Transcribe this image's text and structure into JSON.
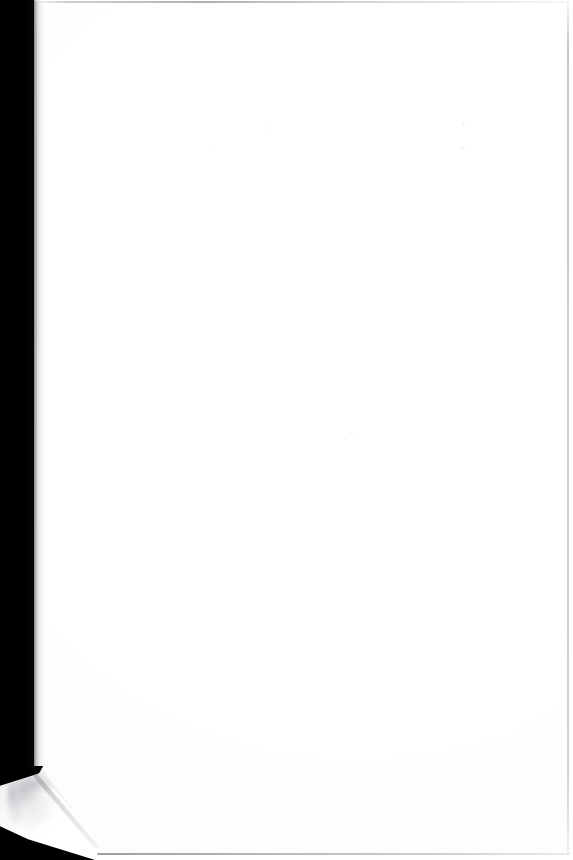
{
  "document": {
    "kind": "scanned-page",
    "description": "Scanned blank page from a bound volume",
    "page_text": "",
    "has_text": "false",
    "has_figures": "false",
    "has_tables": "false",
    "body_note": ""
  },
  "canvas": {
    "width_px": "573",
    "height_px": "860",
    "background_color": "#ffffff"
  },
  "scan_artifacts": {
    "gutter": {
      "name": "left-black-gutter",
      "description": "Black scanner-bed band along the left margin",
      "color": "#000000",
      "width_px": "34",
      "side": "left"
    },
    "gutter_falloff": {
      "name": "gutter-shadow-falloff",
      "description": "Soft gradient from black bed into the white sheet",
      "start_x_px": "32",
      "width_px": "14"
    },
    "dogear": {
      "name": "folded-bottom-left-corner",
      "description": "Dog-eared corner folded back, exposing mottled underside",
      "origin_x_px": "0",
      "origin_y_px": "766",
      "width_px": "108",
      "height_px": "94",
      "fold_shadow_color": "#56585e"
    },
    "page_edges": {
      "top_edge_color": "#7e8088",
      "right_edge_color": "#8c8e96",
      "bottom_edge_color": "#767880",
      "left_edge_color": "#8e9098"
    },
    "paper": {
      "tone_color": "#ffffff",
      "shade_color": "#fbfbfc"
    },
    "specks": [
      {
        "name": "scan-speck",
        "x_px": "462",
        "y_px": "123"
      },
      {
        "name": "scan-speck",
        "x_px": "461",
        "y_px": "147"
      },
      {
        "name": "scan-speck",
        "x_px": "212",
        "y_px": "147"
      },
      {
        "name": "scan-speck",
        "x_px": "266",
        "y_px": "127"
      },
      {
        "name": "scan-speck",
        "x_px": "350",
        "y_px": "432"
      }
    ]
  }
}
